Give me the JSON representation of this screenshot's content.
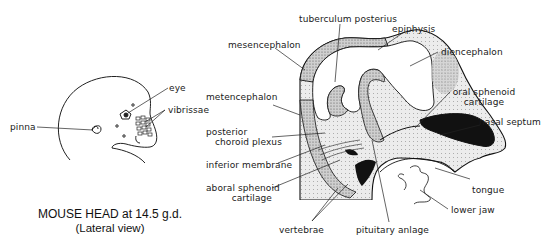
{
  "figure": {
    "title": "MOUSE HEAD at 14.5 g.d.",
    "subtitle": "(Lateral view)"
  },
  "external_view": {
    "labels": {
      "pinna": "pinna",
      "eye": "eye",
      "vibrissae": "vibrissae"
    }
  },
  "section_view": {
    "labels": {
      "tuberculum_posterius": "tuberculum posterius",
      "epiphysis": "epiphysis",
      "mesencephalon": "mesencephalon",
      "diencephalon": "diencephalon",
      "metencephalon": "metencephalon",
      "oral_sphenoid_1": "oral sphenoid",
      "oral_sphenoid_2": "cartilage",
      "nasal_septum": "nasal septum",
      "posterior_choroid_1": "posterior",
      "posterior_choroid_2": "choroid plexus",
      "inferior_membrane": "inferior membrane",
      "aboral_sphenoid_1": "aboral sphenoid",
      "aboral_sphenoid_2": "cartilage",
      "tongue": "tongue",
      "lower_jaw": "lower jaw",
      "vertebrae": "vertebrae",
      "pituitary_anlage": "pituitary anlage"
    }
  },
  "colors": {
    "ink": "#111111",
    "stipple": "#9a9a9a",
    "fill_light": "#e6e6e6",
    "background": "#ffffff"
  }
}
